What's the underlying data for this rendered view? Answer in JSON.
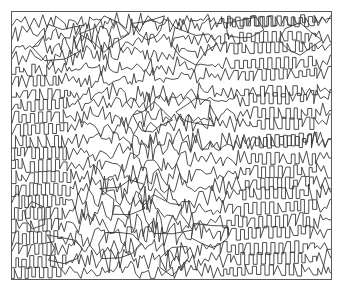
{
  "figure": {
    "type": "line-art",
    "width": 345,
    "height": 293,
    "background_color": "#ffffff",
    "line_color": "#3a3a3a",
    "frame_color": "#5a5a5a",
    "frame": {
      "x": 11,
      "y": 11,
      "width": 321,
      "height": 269,
      "stroke_width": 1
    },
    "regions": [
      {
        "name": "upper-left-blobs",
        "character": "irregular closed jagged blobs"
      },
      {
        "name": "left-staircase",
        "character": "ordered diagonal staircase ridges"
      },
      {
        "name": "center-chaos",
        "character": "open irregular star polygons"
      },
      {
        "name": "right-zigzag",
        "character": "dense regular zigzag bands"
      },
      {
        "name": "lower-center-chaos",
        "character": "dense tangled jagged shapes"
      }
    ],
    "geometry": {
      "zigzag_period_px": 8,
      "zigzag_amplitude_px": 5,
      "band_spacing_px": 12,
      "staircase_step_px": 9
    }
  },
  "chart_data": {
    "type": "line",
    "xlabel": "",
    "ylabel": "",
    "grid": false,
    "legend": "none",
    "xlim": [
      11,
      332
    ],
    "ylim": [
      11,
      280
    ],
    "series": [
      {
        "name": "contour-band-01",
        "kind": "zigzag",
        "y0": 22,
        "x_start": 12,
        "x_end": 331,
        "amp": 5.0,
        "period": 8.5,
        "slope": -0.02,
        "disorder": 0.55
      },
      {
        "name": "contour-band-02",
        "kind": "zigzag",
        "y0": 34,
        "x_start": 12,
        "x_end": 331,
        "amp": 5.2,
        "period": 8.5,
        "slope": -0.03,
        "disorder": 0.6
      },
      {
        "name": "contour-band-03",
        "kind": "zigzag",
        "y0": 46,
        "x_start": 12,
        "x_end": 331,
        "amp": 5.4,
        "period": 8.6,
        "slope": -0.02,
        "disorder": 0.58
      },
      {
        "name": "contour-band-04",
        "kind": "zigzag",
        "y0": 58,
        "x_start": 12,
        "x_end": 331,
        "amp": 5.3,
        "period": 8.4,
        "slope": -0.04,
        "disorder": 0.5
      },
      {
        "name": "contour-band-05",
        "kind": "zigzag",
        "y0": 70,
        "x_start": 12,
        "x_end": 331,
        "amp": 5.5,
        "period": 8.5,
        "slope": -0.03,
        "disorder": 0.46
      },
      {
        "name": "contour-band-06",
        "kind": "zigzag",
        "y0": 82,
        "x_start": 12,
        "x_end": 331,
        "amp": 5.4,
        "period": 8.6,
        "slope": -0.03,
        "disorder": 0.44
      },
      {
        "name": "contour-band-07",
        "kind": "zigzag",
        "y0": 94,
        "x_start": 12,
        "x_end": 331,
        "amp": 5.6,
        "period": 8.5,
        "slope": -0.02,
        "disorder": 0.48
      },
      {
        "name": "contour-band-08",
        "kind": "zigzag",
        "y0": 106,
        "x_start": 12,
        "x_end": 331,
        "amp": 5.5,
        "period": 8.4,
        "slope": -0.03,
        "disorder": 0.52
      },
      {
        "name": "contour-band-09",
        "kind": "zigzag",
        "y0": 118,
        "x_start": 12,
        "x_end": 331,
        "amp": 5.7,
        "period": 8.5,
        "slope": -0.02,
        "disorder": 0.56
      },
      {
        "name": "contour-band-10",
        "kind": "zigzag",
        "y0": 130,
        "x_start": 12,
        "x_end": 331,
        "amp": 5.6,
        "period": 8.6,
        "slope": -0.03,
        "disorder": 0.6
      },
      {
        "name": "contour-band-11",
        "kind": "zigzag",
        "y0": 142,
        "x_start": 12,
        "x_end": 331,
        "amp": 5.8,
        "period": 8.5,
        "slope": -0.02,
        "disorder": 0.62
      },
      {
        "name": "contour-band-12",
        "kind": "zigzag",
        "y0": 154,
        "x_start": 12,
        "x_end": 331,
        "amp": 5.7,
        "period": 8.4,
        "slope": -0.03,
        "disorder": 0.58
      },
      {
        "name": "contour-band-13",
        "kind": "zigzag",
        "y0": 166,
        "x_start": 12,
        "x_end": 331,
        "amp": 5.9,
        "period": 8.5,
        "slope": -0.02,
        "disorder": 0.55
      },
      {
        "name": "contour-band-14",
        "kind": "zigzag",
        "y0": 178,
        "x_start": 12,
        "x_end": 331,
        "amp": 5.8,
        "period": 8.6,
        "slope": -0.03,
        "disorder": 0.58
      },
      {
        "name": "contour-band-15",
        "kind": "zigzag",
        "y0": 190,
        "x_start": 12,
        "x_end": 331,
        "amp": 6.0,
        "period": 8.5,
        "slope": -0.02,
        "disorder": 0.64
      },
      {
        "name": "contour-band-16",
        "kind": "zigzag",
        "y0": 202,
        "x_start": 12,
        "x_end": 331,
        "amp": 5.9,
        "period": 8.4,
        "slope": -0.03,
        "disorder": 0.7
      },
      {
        "name": "contour-band-17",
        "kind": "zigzag",
        "y0": 214,
        "x_start": 12,
        "x_end": 331,
        "amp": 6.0,
        "period": 8.5,
        "slope": -0.02,
        "disorder": 0.76
      },
      {
        "name": "contour-band-18",
        "kind": "zigzag",
        "y0": 226,
        "x_start": 12,
        "x_end": 331,
        "amp": 6.1,
        "period": 8.6,
        "slope": -0.03,
        "disorder": 0.8
      },
      {
        "name": "contour-band-19",
        "kind": "zigzag",
        "y0": 238,
        "x_start": 12,
        "x_end": 331,
        "amp": 6.0,
        "period": 8.5,
        "slope": -0.02,
        "disorder": 0.78
      },
      {
        "name": "contour-band-20",
        "kind": "zigzag",
        "y0": 250,
        "x_start": 12,
        "x_end": 331,
        "amp": 6.1,
        "period": 8.4,
        "slope": -0.03,
        "disorder": 0.74
      },
      {
        "name": "contour-band-21",
        "kind": "zigzag",
        "y0": 262,
        "x_start": 12,
        "x_end": 331,
        "amp": 5.9,
        "period": 8.5,
        "slope": -0.02,
        "disorder": 0.68
      },
      {
        "name": "contour-band-22",
        "kind": "zigzag",
        "y0": 273,
        "x_start": 12,
        "x_end": 331,
        "amp": 5.2,
        "period": 8.5,
        "slope": -0.02,
        "disorder": 0.6
      }
    ],
    "order_field": {
      "note": "Per-band local order varies with x: staircase-ordered near left and right, chaotic in center/bottom",
      "ordered_zones_x": [
        [
          12,
          115
        ],
        [
          205,
          331
        ]
      ],
      "chaotic_zones_x": [
        [
          115,
          205
        ]
      ]
    }
  }
}
